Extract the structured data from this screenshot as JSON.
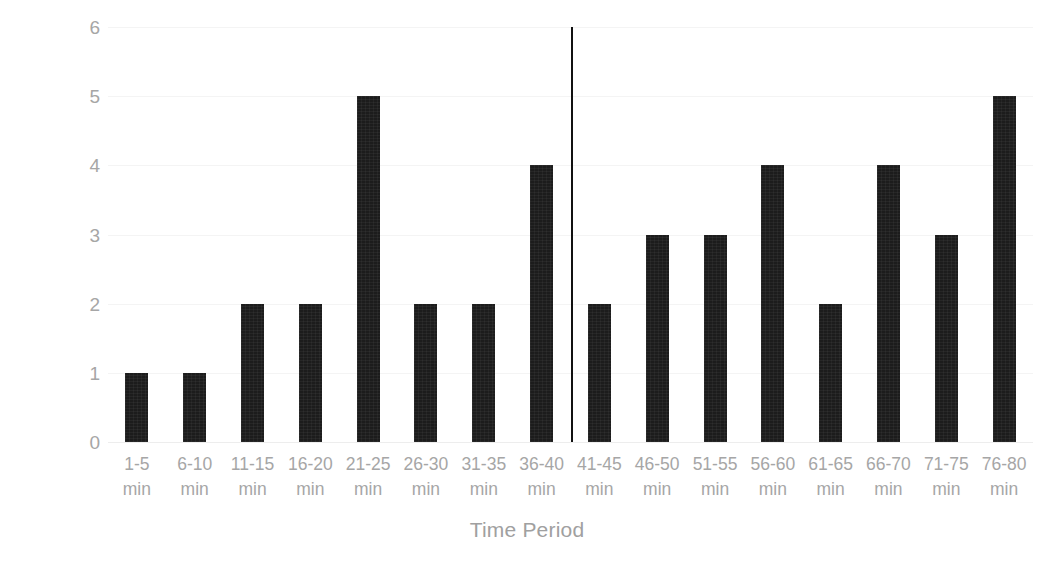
{
  "chart_data": {
    "type": "bar",
    "title": "",
    "xlabel": "Time Period",
    "ylabel": "Drop Goals Scored",
    "categories": [
      "1-5 min",
      "6-10 min",
      "11-15 min",
      "16-20 min",
      "21-25 min",
      "26-30 min",
      "31-35 min",
      "36-40 min",
      "41-45 min",
      "46-50 min",
      "51-55 min",
      "56-60 min",
      "61-65 min",
      "66-70 min",
      "71-75 min",
      "76-80 min"
    ],
    "category_lines": [
      [
        "1-5",
        "min"
      ],
      [
        "6-10",
        "min"
      ],
      [
        "11-15",
        "min"
      ],
      [
        "16-20",
        "min"
      ],
      [
        "21-25",
        "min"
      ],
      [
        "26-30",
        "min"
      ],
      [
        "31-35",
        "min"
      ],
      [
        "36-40",
        "min"
      ],
      [
        "41-45",
        "min"
      ],
      [
        "46-50",
        "min"
      ],
      [
        "51-55",
        "min"
      ],
      [
        "56-60",
        "min"
      ],
      [
        "61-65",
        "min"
      ],
      [
        "66-70",
        "min"
      ],
      [
        "71-75",
        "min"
      ],
      [
        "76-80",
        "min"
      ]
    ],
    "values": [
      1,
      1,
      2,
      2,
      5,
      2,
      2,
      4,
      2,
      3,
      3,
      4,
      2,
      4,
      3,
      5
    ],
    "ylim": [
      0,
      6
    ],
    "ytick_values": [
      0,
      1,
      2,
      3,
      4,
      5,
      6
    ],
    "ytick_labels": [
      "0",
      "1",
      "2",
      "3",
      "4",
      "5",
      "6"
    ],
    "grid": true,
    "legend": false,
    "bar_color": "#1c1c1c",
    "text_color": "#a6a6a6",
    "gridline_color": "#f4f4f4",
    "background_color": "#ffffff",
    "annotations": [
      {
        "name": "half-time-divider",
        "kind": "vertical-line",
        "after_category": "36-40 min",
        "color": "#111111"
      }
    ]
  }
}
